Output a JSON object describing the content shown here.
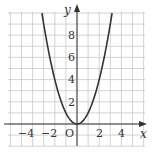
{
  "chart_data": {
    "type": "line",
    "title": "",
    "function": "y = x^2",
    "xlabel": "x",
    "ylabel": "y",
    "origin_label": "O",
    "xlim": [
      -6,
      6
    ],
    "ylim": [
      -2,
      10
    ],
    "grid": true,
    "grid_step": 1,
    "x_ticks": [
      -4,
      -2,
      2,
      4
    ],
    "x_tick_labels": [
      "−4",
      "−2",
      "2",
      "4"
    ],
    "y_ticks": [
      2,
      4,
      6,
      8
    ],
    "y_tick_labels": [
      "2",
      "4",
      "6",
      "8"
    ],
    "series": [
      {
        "name": "y = x^2",
        "x": [
          -3.16,
          -3,
          -2.5,
          -2,
          -1.5,
          -1,
          -0.5,
          0,
          0.5,
          1,
          1.5,
          2,
          2.5,
          3,
          3.16
        ],
        "values": [
          10,
          9,
          6.25,
          4,
          2.25,
          1,
          0.25,
          0,
          0.25,
          1,
          2.25,
          4,
          6.25,
          9,
          10
        ]
      }
    ],
    "colors": {
      "grid": "#c8c8c8",
      "axis": "#333333",
      "curve": "#333333",
      "background": "#ffffff"
    }
  }
}
